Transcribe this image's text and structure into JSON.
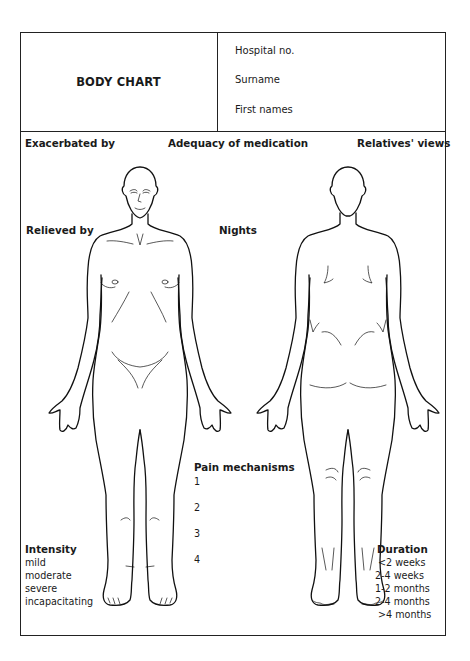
{
  "header": {
    "title": "BODY CHART",
    "fields": [
      {
        "label": "Hospital no."
      },
      {
        "label": "Surname"
      },
      {
        "label": "First names"
      }
    ]
  },
  "top_labels": {
    "exacerbated_by": "Exacerbated by",
    "adequacy_of_medication": "Adequacy of medication",
    "relatives_views": "Relatives' views"
  },
  "mid_labels": {
    "relieved_by": "Relieved by",
    "nights": "Nights"
  },
  "figures": {
    "front": "body-front-outline",
    "back": "body-back-outline"
  },
  "pain_mechanisms": {
    "title": "Pain mechanisms",
    "items": [
      "1",
      "2",
      "3",
      "4"
    ]
  },
  "intensity": {
    "title": "Intensity",
    "options": [
      "mild",
      "moderate",
      "severe",
      "incapacitating"
    ]
  },
  "duration": {
    "title": "Duration",
    "options": [
      "<2 weeks",
      "2-4 weeks",
      "1-2 months",
      "2-4 months",
      ">4 months"
    ]
  }
}
